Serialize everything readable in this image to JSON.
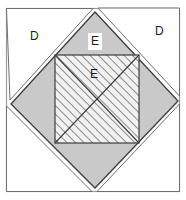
{
  "figure": {
    "type": "geometric-diagram",
    "canvas": {
      "width": 186,
      "height": 200,
      "background": "#ffffff"
    },
    "colors": {
      "background": "#ffffff",
      "diamond_fill": "#c9c9c9",
      "corner_triangle_fill": "#ffffff",
      "hatch_fill": "#f2f2f2",
      "hatch_stroke": "#4d4d4d",
      "outline": "#3c3c3c",
      "thin_frame": "#9a9a9a",
      "label_text": "#1a1a1a",
      "label_box": "#ffffff"
    },
    "labels": [
      {
        "id": "label-d-left",
        "text": "D",
        "x": 30,
        "y": 30,
        "boxed": false
      },
      {
        "id": "label-d-right",
        "text": "D",
        "x": 155,
        "y": 25,
        "boxed": false
      },
      {
        "id": "label-e-upper",
        "text": "E",
        "x": 88,
        "y": 33,
        "boxed": true
      },
      {
        "id": "label-e-inner",
        "text": "E",
        "x": 90,
        "y": 68,
        "boxed": false
      }
    ],
    "shapes": {
      "outer_frame": {
        "x": 6,
        "y": 8,
        "width": 174,
        "height": 184
      },
      "diamond": {
        "top": {
          "x": 95,
          "y": 12
        },
        "right": {
          "x": 178,
          "y": 101
        },
        "bottom": {
          "x": 95,
          "y": 188
        },
        "left": {
          "x": 11,
          "y": 104
        }
      },
      "inner_square": {
        "x": 55,
        "y": 55,
        "width": 84,
        "height": 88
      },
      "inner_diagonals": [
        "top-left-to-bottom-right",
        "bottom-left-to-top-right"
      ],
      "detached_triangle_top_right": {
        "note": "offset white triangle at upper right"
      },
      "detached_triangle_bottom_left": {
        "note": "offset white triangle at lower left"
      }
    }
  }
}
